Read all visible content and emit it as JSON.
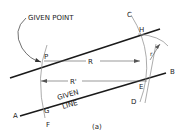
{
  "figure": {
    "caption": "(a)",
    "labels": {
      "given_point": "GIVEN POINT",
      "given_line_1": "GIVEN",
      "given_line_2": "LINE",
      "P": "P",
      "R": "R",
      "R_prime": "R'",
      "r": "r",
      "A": "A",
      "B": "B",
      "C": "C",
      "D": "D",
      "E": "E",
      "F": "F",
      "G": "G",
      "H": "H"
    },
    "colors": {
      "line": "#1a1a1a",
      "construction": "#777777",
      "text": "#222222"
    }
  }
}
